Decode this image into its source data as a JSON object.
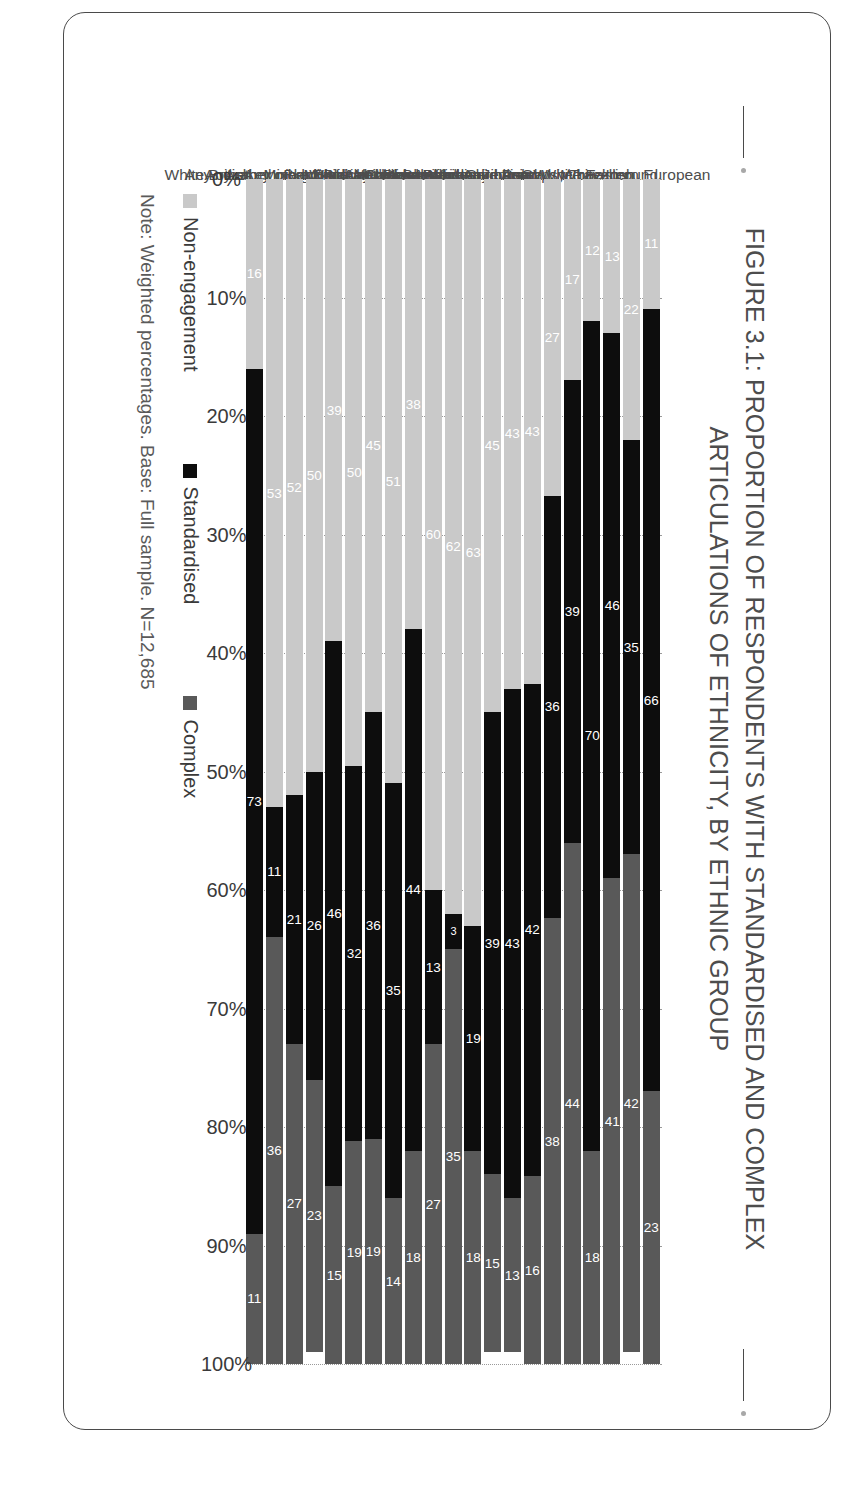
{
  "figure": {
    "title_lines": [
      "FIGURE 3.1: PROPORTION OF RESPONDENTS WITH STANDARDISED AND COMPLEX",
      "ARTICULATIONS OF ETHNICITY, BY ETHNIC GROUP"
    ],
    "note": "Note: Weighted percentages. Base: Full sample. N=12,685"
  },
  "legend": {
    "items": [
      {
        "label": "Non-engagement",
        "color": "#c9c9c9"
      },
      {
        "label": "Standardised",
        "color": "#0d0d0d"
      },
      {
        "label": "Complex",
        "color": "#595959"
      }
    ]
  },
  "axis": {
    "ticks": [
      "0%",
      "10%",
      "20%",
      "30%",
      "40%",
      "50%",
      "60%",
      "70%",
      "80%",
      "90%",
      "100%"
    ]
  },
  "chart_data": {
    "type": "bar",
    "orientation": "horizontal",
    "stacked": true,
    "title": "FIGURE 3.1: PROPORTION OF RESPONDENTS WITH STANDARDISED AND COMPLEX ARTICULATIONS OF ETHNICITY, BY ETHNIC GROUP",
    "xlabel": "",
    "ylabel": "",
    "xlim": [
      0,
      100
    ],
    "grid": true,
    "legend_position": "bottom-left",
    "categories": [
      "White Irish",
      "White Eastern European",
      "Gypsy/Traveller",
      "Roma",
      "Jewish",
      "Any other White background",
      "Indian",
      "Pakistani",
      "Bangladeshi",
      "Mixed White and Asian",
      "Chinese",
      "Any other Asian background",
      "Black Caribbean",
      "Mixed White and Black Caribbean",
      "Black African",
      "Mixed White and Black African",
      "Any other Black background",
      "Arab",
      "Any other mixed/multiple background",
      "Any other ethnic group",
      "White British"
    ],
    "series": [
      {
        "name": "Non-engagement",
        "color": "#c9c9c9",
        "values": [
          11,
          22,
          13,
          12,
          17,
          27,
          43,
          43,
          45,
          63,
          62,
          60,
          38,
          51,
          45,
          50,
          39,
          50,
          52,
          53,
          16
        ]
      },
      {
        "name": "Standardised",
        "color": "#0d0d0d",
        "values": [
          66,
          35,
          46,
          70,
          39,
          36,
          42,
          43,
          39,
          19,
          3,
          13,
          44,
          35,
          36,
          32,
          46,
          26,
          21,
          11,
          73
        ]
      },
      {
        "name": "Complex",
        "color": "#595959",
        "values": [
          23,
          42,
          41,
          18,
          44,
          38,
          16,
          13,
          15,
          18,
          35,
          27,
          18,
          14,
          19,
          19,
          15,
          23,
          27,
          36,
          11
        ]
      }
    ]
  }
}
